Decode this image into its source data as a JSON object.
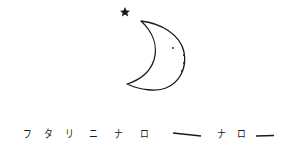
{
  "illustration": {
    "subject": "crescent moon with star",
    "icons": [
      "star-icon",
      "crescent-moon-icon"
    ],
    "stroke_color": "#1a1a1a",
    "background": "#ffffff"
  },
  "caption": {
    "text": "フタリニナロー ナロー",
    "chars": [
      {
        "c": "フ",
        "x": 22
      },
      {
        "c": "タ",
        "x": 43
      },
      {
        "c": "リ",
        "x": 64
      },
      {
        "c": "ニ",
        "x": 88
      },
      {
        "c": "ナ",
        "x": 113
      },
      {
        "c": "ロ",
        "x": 139
      },
      {
        "c": "ナ",
        "x": 216
      },
      {
        "c": "ロ",
        "x": 236
      }
    ]
  }
}
